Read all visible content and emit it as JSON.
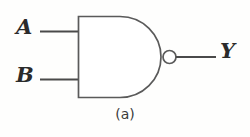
{
  "figure": {
    "type": "logic-gate-diagram",
    "gate_type": "NAND",
    "caption": "(a)",
    "background_color": "#fefefd",
    "stroke_color": "#4a4a4a",
    "label_color": "#2b2b2b",
    "inputs": [
      {
        "name": "input-a",
        "label": "A"
      },
      {
        "name": "input-b",
        "label": "B"
      }
    ],
    "outputs": [
      {
        "name": "output-y",
        "label": "Y"
      }
    ],
    "bubble": {
      "name": "inversion-bubble",
      "present": "true"
    }
  }
}
